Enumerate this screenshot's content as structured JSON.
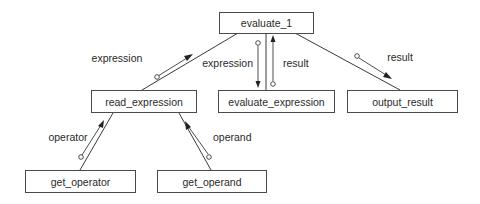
{
  "diagram": {
    "type": "structure-chart",
    "nodes": [
      {
        "id": "evaluate_1",
        "label": "evaluate_1"
      },
      {
        "id": "read_expression",
        "label": "read_expression"
      },
      {
        "id": "evaluate_expression",
        "label": "evaluate_expression"
      },
      {
        "id": "output_result",
        "label": "output_result"
      },
      {
        "id": "get_operator",
        "label": "get_operator"
      },
      {
        "id": "get_operand",
        "label": "get_operand"
      }
    ],
    "edges": [
      {
        "from": "evaluate_1",
        "to": "read_expression"
      },
      {
        "from": "evaluate_1",
        "to": "evaluate_expression"
      },
      {
        "from": "evaluate_1",
        "to": "output_result"
      },
      {
        "from": "read_expression",
        "to": "get_operator"
      },
      {
        "from": "read_expression",
        "to": "get_operand"
      }
    ],
    "data_flows": [
      {
        "label": "expression",
        "from": "read_expression",
        "to": "evaluate_1"
      },
      {
        "label": "expression",
        "from": "evaluate_1",
        "to": "evaluate_expression"
      },
      {
        "label": "result",
        "from": "evaluate_expression",
        "to": "evaluate_1"
      },
      {
        "label": "result",
        "from": "evaluate_1",
        "to": "output_result"
      },
      {
        "label": "operator",
        "from": "get_operator",
        "to": "read_expression"
      },
      {
        "label": "operand",
        "from": "get_operand",
        "to": "read_expression"
      }
    ]
  }
}
